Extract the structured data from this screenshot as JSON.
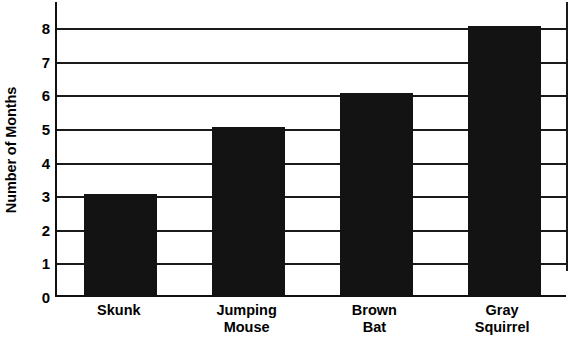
{
  "chart_data": {
    "type": "bar",
    "title": "",
    "xlabel": "",
    "ylabel": "Number of Months",
    "categories": [
      "Skunk",
      "Jumping Mouse",
      "Brown Bat",
      "Gray Squirrel"
    ],
    "category_lines": [
      [
        "Skunk"
      ],
      [
        "Jumping",
        "Mouse"
      ],
      [
        "Brown",
        "Bat"
      ],
      [
        "Gray",
        "Squirrel"
      ]
    ],
    "values": [
      3,
      5,
      6,
      8
    ],
    "ylim": [
      0,
      8
    ],
    "ytick_labels": [
      "0",
      "1",
      "2",
      "3",
      "4",
      "5",
      "6",
      "7",
      "8"
    ],
    "ytick_values": [
      0,
      1,
      2,
      3,
      4,
      5,
      6,
      7,
      8
    ],
    "grid": true,
    "grid_orientation": "horizontal",
    "legend": false,
    "bar_color": "#131313",
    "axis_color": "#1a1a1a",
    "background_color": "#ffffff"
  }
}
